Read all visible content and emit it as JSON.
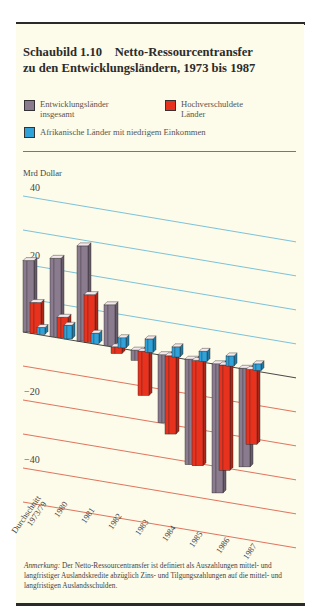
{
  "figure": {
    "title_line1": "Schaubild 1.10    Netto-Ressourcentransfer",
    "title_line2": "zu den Entwicklungsländern, 1973 bis 1987"
  },
  "legend": {
    "items": [
      {
        "label_line1": "Entwicklungsländer",
        "label_line2": "insgesamt",
        "color": "#8b7b8f"
      },
      {
        "label_line1": "Hochverschuldete",
        "label_line2": "Länder",
        "color": "#e8321e"
      },
      {
        "label_line1": "Afrikanische Länder mit niedrigem Einkommen",
        "label_line2": "",
        "color": "#2fa2da"
      }
    ]
  },
  "note": {
    "label": "Anmerkung:",
    "text": " Der Netto-Ressourcentransfer ist definiert als Auszahlungen mittel- und langfristiger Auslandskredite abzüglich Zins- und Tilgungszahlungen auf die mittel- und langfristigen Auslandsschulden."
  },
  "chart_data": {
    "type": "bar",
    "title": "Netto-Ressourcentransfer zu den Entwicklungsländern, 1973 bis 1987",
    "ylabel": "Mrd Dollar",
    "xlabel": "",
    "ylim": [
      -45,
      40
    ],
    "yticks": [
      40,
      20,
      0,
      -20,
      -40
    ],
    "grid": true,
    "legend_position": "top",
    "categories": [
      "Durchschnitt 1973/79",
      "1980",
      "1981",
      "1982",
      "1983",
      "1984",
      "1985",
      "1986",
      "1987"
    ],
    "series": [
      {
        "name": "Entwicklungsländer insgesamt",
        "color": "#8b7b8f",
        "values": [
          21,
          23,
          28,
          12,
          -3,
          -20,
          -31,
          -38,
          -29
        ]
      },
      {
        "name": "Hochverschuldete Länder",
        "color": "#e8321e",
        "values": [
          9,
          6,
          14,
          -2,
          -13,
          -23,
          -31,
          -31,
          -22
        ]
      },
      {
        "name": "Afrikanische Länder mit niedrigem Einkommen",
        "color": "#2fa2da",
        "values": [
          2,
          4,
          3,
          3,
          4,
          3,
          3,
          3,
          2
        ]
      }
    ]
  }
}
